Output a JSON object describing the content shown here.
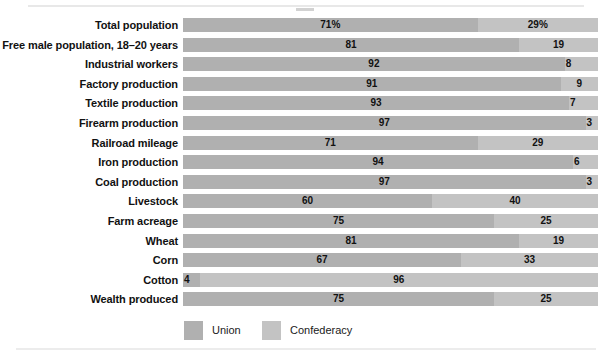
{
  "chart_data": {
    "type": "bar",
    "subtype": "stacked-horizontal-100pct",
    "title": "",
    "xlabel": "",
    "ylabel": "",
    "xlim": [
      0,
      100
    ],
    "grid": false,
    "legend_position": "bottom-left",
    "categories": [
      "Total population",
      "Free male population, 18–20 years",
      "Industrial workers",
      "Factory production",
      "Textile production",
      "Firearm production",
      "Railroad mileage",
      "Iron production",
      "Coal production",
      "Livestock",
      "Farm acreage",
      "Wheat",
      "Corn",
      "Cotton",
      "Wealth produced"
    ],
    "series": [
      {
        "name": "Union",
        "color": "#b0b0b0",
        "values": [
          71,
          81,
          92,
          91,
          93,
          97,
          71,
          94,
          97,
          60,
          75,
          81,
          67,
          4,
          75
        ],
        "labels": [
          "71%",
          "81",
          "92",
          "91",
          "93",
          "97",
          "71",
          "94",
          "97",
          "60",
          "75",
          "81",
          "67",
          "4",
          "75"
        ]
      },
      {
        "name": "Confederacy",
        "color": "#c3c3c3",
        "values": [
          29,
          19,
          8,
          9,
          7,
          3,
          29,
          6,
          3,
          40,
          25,
          19,
          33,
          96,
          25
        ],
        "labels": [
          "29%",
          "19",
          "8",
          "9",
          "7",
          "3",
          "29",
          "6",
          "3",
          "40",
          "25",
          "19",
          "33",
          "96",
          "25"
        ]
      }
    ],
    "legend": [
      {
        "label": "Union",
        "color": "#b0b0b0"
      },
      {
        "label": "Confederacy",
        "color": "#c3c3c3"
      }
    ]
  },
  "rows": [
    {
      "label": "Total population",
      "union": 71,
      "confederacy": 29,
      "union_label": "71%",
      "confederacy_label": "29%"
    },
    {
      "label": "Free male population, 18–20 years",
      "union": 81,
      "confederacy": 19,
      "union_label": "81",
      "confederacy_label": "19"
    },
    {
      "label": "Industrial workers",
      "union": 92,
      "confederacy": 8,
      "union_label": "92",
      "confederacy_label": "8"
    },
    {
      "label": "Factory production",
      "union": 91,
      "confederacy": 9,
      "union_label": "91",
      "confederacy_label": "9"
    },
    {
      "label": "Textile production",
      "union": 93,
      "confederacy": 7,
      "union_label": "93",
      "confederacy_label": "7"
    },
    {
      "label": "Firearm production",
      "union": 97,
      "confederacy": 3,
      "union_label": "97",
      "confederacy_label": "3"
    },
    {
      "label": "Railroad mileage",
      "union": 71,
      "confederacy": 29,
      "union_label": "71",
      "confederacy_label": "29"
    },
    {
      "label": "Iron production",
      "union": 94,
      "confederacy": 6,
      "union_label": "94",
      "confederacy_label": "6"
    },
    {
      "label": "Coal production",
      "union": 97,
      "confederacy": 3,
      "union_label": "97",
      "confederacy_label": "3"
    },
    {
      "label": "Livestock",
      "union": 60,
      "confederacy": 40,
      "union_label": "60",
      "confederacy_label": "40"
    },
    {
      "label": "Farm acreage",
      "union": 75,
      "confederacy": 25,
      "union_label": "75",
      "confederacy_label": "25"
    },
    {
      "label": "Wheat",
      "union": 81,
      "confederacy": 19,
      "union_label": "81",
      "confederacy_label": "19"
    },
    {
      "label": "Corn",
      "union": 67,
      "confederacy": 33,
      "union_label": "67",
      "confederacy_label": "33"
    },
    {
      "label": "Cotton",
      "union": 4,
      "confederacy": 96,
      "union_label": "4",
      "confederacy_label": "96"
    },
    {
      "label": "Wealth produced",
      "union": 75,
      "confederacy": 25,
      "union_label": "75",
      "confederacy_label": "25"
    }
  ],
  "legend": {
    "union_label": "Union",
    "confederacy_label": "Confederacy"
  },
  "colors": {
    "union": "#b0b0b0",
    "confederacy": "#c3c3c3",
    "text": "#111111",
    "background": "#ffffff"
  }
}
